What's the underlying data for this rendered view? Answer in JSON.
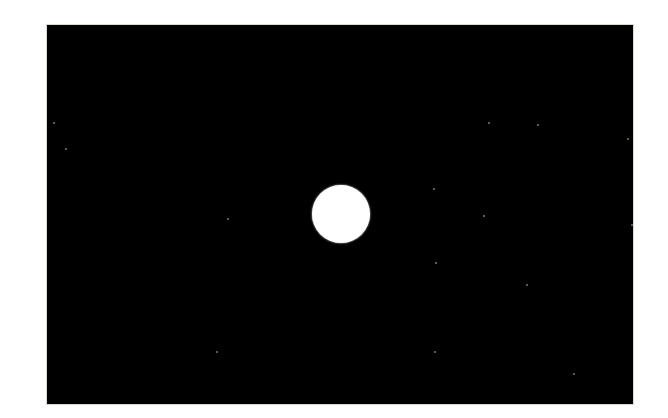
{
  "scene": {
    "background_color": "#000000",
    "page_color": "#ffffff",
    "circle": {
      "cx": 340,
      "cy": 213,
      "r": 29,
      "color": "#ffffff"
    },
    "stars": [
      [
        52,
        121
      ],
      [
        64,
        147
      ],
      [
        226,
        217
      ],
      [
        487,
        121
      ],
      [
        536,
        123
      ],
      [
        626,
        137
      ],
      [
        432,
        187
      ],
      [
        482,
        214
      ],
      [
        630,
        223
      ],
      [
        434,
        261
      ],
      [
        525,
        283
      ],
      [
        215,
        350
      ],
      [
        572,
        372
      ],
      [
        433,
        350
      ]
    ]
  }
}
